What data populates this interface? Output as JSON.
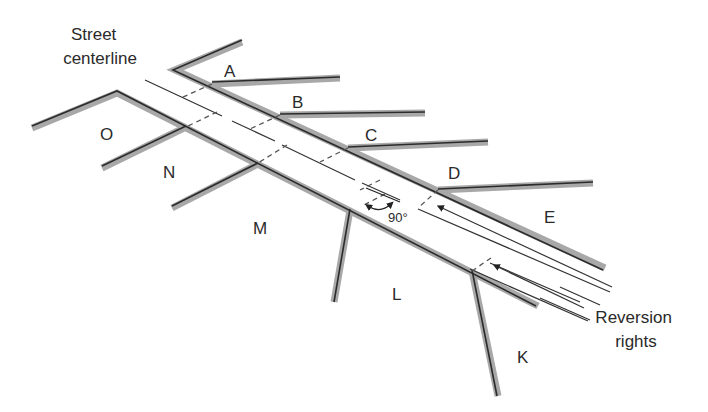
{
  "diagram": {
    "title_label_line1": "Street",
    "title_label_line2": "centerline",
    "reversion_label_line1": "Reversion",
    "reversion_label_line2": "rights",
    "angle_label": "90°",
    "lots": [
      {
        "id": "A",
        "x": 232,
        "y": 71
      },
      {
        "id": "B",
        "x": 300,
        "y": 104
      },
      {
        "id": "C",
        "x": 372,
        "y": 138
      },
      {
        "id": "D",
        "x": 456,
        "y": 177
      },
      {
        "id": "E",
        "x": 550,
        "y": 221
      },
      {
        "id": "O",
        "x": 108,
        "y": 138
      },
      {
        "id": "N",
        "x": 170,
        "y": 175
      },
      {
        "id": "M",
        "x": 262,
        "y": 233
      },
      {
        "id": "L",
        "x": 398,
        "y": 297
      },
      {
        "id": "K",
        "x": 524,
        "y": 360
      }
    ],
    "colors": {
      "lot_line_shadow": "#a8a8a8",
      "lot_line": "#2b2b2b",
      "centerline": "#333333",
      "dashed": "#555555",
      "text": "#2a2a2a"
    }
  }
}
